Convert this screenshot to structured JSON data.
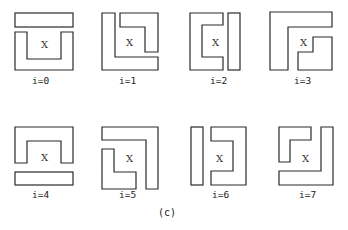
{
  "figure": {
    "caption": "(c)",
    "center_mark": "X",
    "panels": [
      {
        "label": "i=0",
        "center_mark": "X"
      },
      {
        "label": "i=1",
        "center_mark": "X"
      },
      {
        "label": "i=2",
        "center_mark": "X"
      },
      {
        "label": "i=3",
        "center_mark": "X"
      },
      {
        "label": "i=4",
        "center_mark": "X"
      },
      {
        "label": "i=5",
        "center_mark": "X"
      },
      {
        "label": "i=6",
        "center_mark": "X"
      },
      {
        "label": "i=7",
        "center_mark": "X"
      }
    ]
  },
  "colors": {
    "stroke": "#2a2a2a",
    "background": "#ffffff",
    "text": "#222222"
  }
}
